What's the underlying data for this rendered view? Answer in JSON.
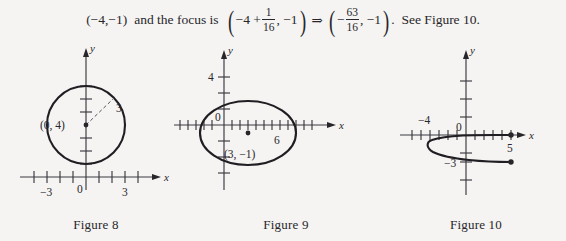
{
  "equation": {
    "lead_point": "(−4,−1)",
    "connector": "and the focus is",
    "focus_expr_lead": "−4 +",
    "focus_expr_frac_num": "1",
    "focus_expr_frac_den": "16",
    "focus_expr_tail": ", −1",
    "implies": "⇒",
    "result_sign": "−",
    "result_frac_num": "63",
    "result_frac_den": "16",
    "result_tail": ", −1",
    "period": ".",
    "see_text": "See Figure 10.",
    "paren_open": "(",
    "paren_close": ")"
  },
  "figures": [
    {
      "caption": "Figure 8",
      "shape": "circle",
      "center_label": "(0, 4)",
      "radius_label": "3",
      "center": [
        0,
        4
      ],
      "radius": 3,
      "axis_x_label": "x",
      "axis_y_label": "y",
      "x_tick_labels": [
        {
          "value": -3,
          "text": "−3"
        },
        {
          "value": 0,
          "text": "0"
        },
        {
          "value": 3,
          "text": "3"
        }
      ],
      "y_tick_labels": []
    },
    {
      "caption": "Figure 9",
      "shape": "ellipse",
      "center_label": "(3, −1)",
      "center": [
        3,
        -1
      ],
      "semi_axis_x": 6,
      "semi_axis_y": 4,
      "semi_axis_x_label": "6",
      "semi_axis_y_label": "4",
      "axis_x_label": "x",
      "axis_y_label": "y",
      "origin_label": "0"
    },
    {
      "caption": "Figure 10",
      "shape": "parabola",
      "vertex": [
        -4,
        -1
      ],
      "opens": "right",
      "endpoint_x": 5,
      "endpoints": [
        [
          5,
          0
        ],
        [
          5,
          -3
        ]
      ],
      "axis_x_label": "x",
      "axis_y_label": "y",
      "origin_label": "0",
      "x_tick_labels": [
        {
          "value": -4,
          "text": "−4"
        },
        {
          "value": 5,
          "text": "5"
        }
      ],
      "y_tick_labels": [
        {
          "value": -3,
          "text": "−3"
        }
      ]
    }
  ],
  "colors": {
    "paper": "#f5f4f2",
    "ink": "#28262a",
    "curve": "#201e22",
    "axis": "#3a3840"
  }
}
